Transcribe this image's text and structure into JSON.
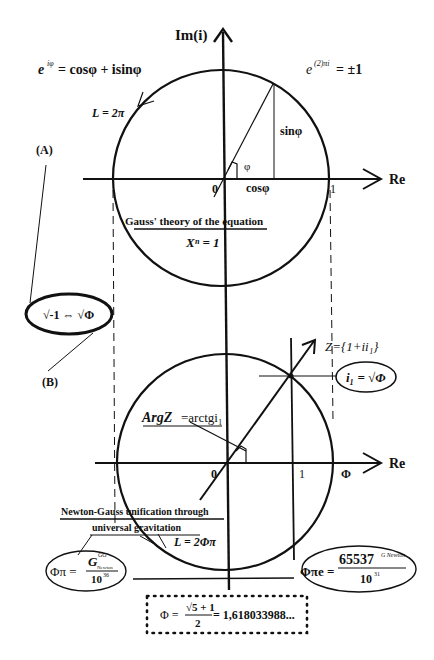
{
  "top_diagram": {
    "axis_y_label": "Im(i)",
    "axis_x_label": "Re",
    "euler_formula": "e^{iφ} = cosφ + isinφ",
    "euler_base": "e",
    "euler_exp": "iφ",
    "euler_rhs": "= cosφ + isinφ",
    "euler_identity_base": "e",
    "euler_identity_exp": "(2)πi",
    "euler_identity_rhs": "= ±1",
    "circumference": "L = 2π",
    "sin_label": "sinφ",
    "cos_label": "cosφ",
    "angle_label": "φ",
    "origin_label": "0",
    "unit_label": "1",
    "caption_line1": "Gauss' theory of the equation",
    "caption_line2": "Xⁿ = 1"
  },
  "labels": {
    "A": "(A)",
    "B": "(B)",
    "equivalence": "√-1 ⇔ √Φ"
  },
  "bottom_diagram": {
    "axis_x_label": "Re",
    "origin_label": "0",
    "unit_label": "1",
    "phi_label": "Φ",
    "z_label": "Z={1+ii₁}",
    "i1_label": "i₁ = √Φ",
    "arg_label_part1": "ArgZ",
    "arg_label_part2": "=arctgi₁",
    "caption_line1": "Newton-Gauss unification through",
    "caption_line2": "universal   gravitation",
    "circumference": "L = 2Φπ"
  },
  "formulas": {
    "left_lhs": "Φπ =",
    "left_num": "G",
    "left_num_sup": "GG",
    "left_num_sub": "Newton",
    "left_den": "10",
    "left_den_exp": "36",
    "right_lhs": "Φπe =",
    "right_num": "65537",
    "right_num_exp": "G Newton",
    "right_den": "10",
    "right_den_exp": "31"
  },
  "golden_ratio_box": {
    "lhs": "Φ =",
    "num": "√5 + 1",
    "den": "2",
    "value": "= 1,618033988..."
  },
  "colors": {
    "ink": "#111111",
    "background": "#ffffff"
  }
}
